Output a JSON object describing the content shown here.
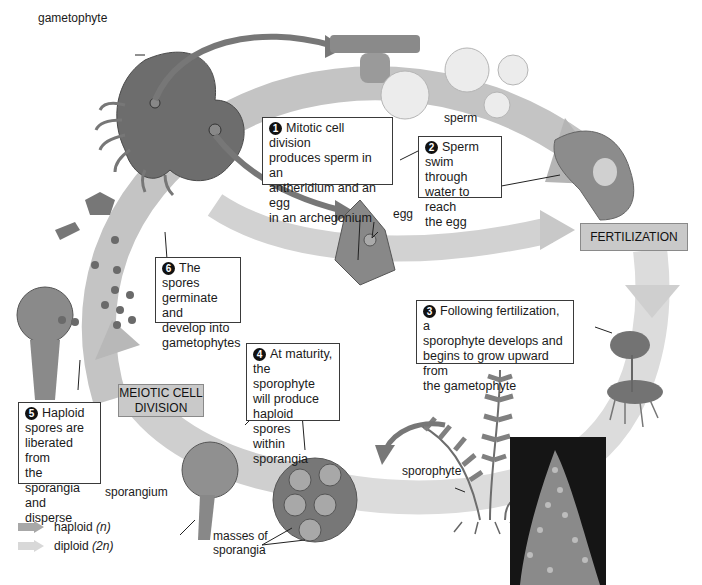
{
  "figure": {
    "colors": {
      "haploid_arrow": "#9a9a9a",
      "diploid_arrow": "#d6d6d6",
      "stage_box": "#c9c9c9",
      "organism": "#6e6e6e",
      "photo_bg": "#151515"
    }
  },
  "labels": {
    "gametophyte": "gametophyte",
    "sperm": "sperm",
    "egg": "egg",
    "sporophyte": "sporophyte",
    "sporangium": "sporangium",
    "masses_of_sporangia_1": "masses of",
    "masses_of_sporangia_2": "sporangia"
  },
  "stages": {
    "fertilization": "FERTILIZATION",
    "meiotic_1": "MEIOTIC CELL",
    "meiotic_2": "DIVISION"
  },
  "steps": [
    {
      "number": "1",
      "lines": [
        "Mitotic cell division",
        "produces sperm in an",
        "antheridium and an egg",
        "in an archegonium"
      ]
    },
    {
      "number": "2",
      "lines": [
        "Sperm",
        "swim through",
        "water to reach",
        "the egg"
      ]
    },
    {
      "number": "3",
      "lines": [
        "Following fertilization, a",
        "sporophyte develops and",
        "begins to grow upward from",
        "the gametophyte"
      ]
    },
    {
      "number": "4",
      "lines": [
        "At maturity,",
        "the sporophyte",
        "will produce",
        "haploid spores",
        "within sporangia"
      ]
    },
    {
      "number": "5",
      "lines": [
        "Haploid",
        "spores are",
        "liberated from",
        "the sporangia",
        "and disperse"
      ]
    },
    {
      "number": "6",
      "lines": [
        "The spores",
        "germinate and",
        "develop into",
        "gametophytes"
      ]
    }
  ],
  "legend": {
    "haploid_label": "haploid",
    "haploid_symbol": "(n)",
    "diploid_label": "diploid",
    "diploid_symbol": "(2n)"
  }
}
